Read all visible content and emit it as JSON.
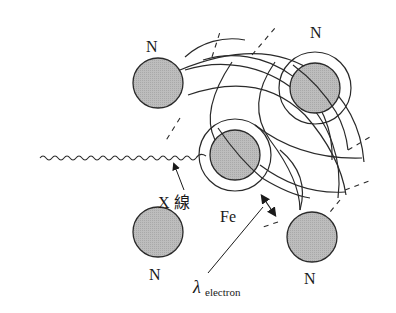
{
  "diagram": {
    "atoms": [
      {
        "id": "n-top-left",
        "label": "N",
        "cx": 158,
        "cy": 83,
        "r": 25,
        "ring": false
      },
      {
        "id": "n-top-right",
        "label": "N",
        "cx": 315,
        "cy": 88,
        "r": 25,
        "ring": true,
        "ring_r": 36
      },
      {
        "id": "fe-center",
        "label": "Fe",
        "cx": 235,
        "cy": 155,
        "r": 25,
        "ring": true,
        "ring_r": 36
      },
      {
        "id": "n-bottom-left",
        "label": "N",
        "cx": 158,
        "cy": 232,
        "r": 25,
        "ring": false
      },
      {
        "id": "n-bottom-right",
        "label": "N",
        "cx": 312,
        "cy": 237,
        "r": 25,
        "ring": false
      }
    ],
    "labels": {
      "n_top_left": "N",
      "n_top_right": "N",
      "fe": "Fe",
      "n_bottom_left": "N",
      "n_bottom_right": "N",
      "xray": "X 線",
      "lambda_symbol": "λ",
      "lambda_subscript": "electron"
    },
    "colors": {
      "atom_fill": "#b8b8b8",
      "stroke": "#2a2a2a",
      "background": "#ffffff"
    }
  }
}
